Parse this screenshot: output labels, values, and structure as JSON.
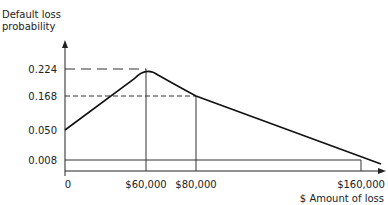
{
  "chart_data": {
    "type": "line",
    "title": "",
    "ylabel_lines": [
      "Default loss",
      "probability"
    ],
    "xlabel": "$ Amount of loss",
    "x_ticks": [
      {
        "value": 0,
        "label": "0"
      },
      {
        "value": 60000,
        "label": "$60,000"
      },
      {
        "value": 80000,
        "label": "$80,000"
      },
      {
        "value": 160000,
        "label": "$160,000"
      }
    ],
    "y_ticks": [
      {
        "value": 0.224,
        "label": "0.224"
      },
      {
        "value": 0.168,
        "label": "0.168"
      },
      {
        "value": 0.05,
        "label": "0.050"
      },
      {
        "value": 0.008,
        "label": "0.008"
      }
    ],
    "series": [
      {
        "name": "Default loss distribution",
        "points": [
          {
            "x": 0,
            "y": 0.05
          },
          {
            "x": 60000,
            "y": 0.224
          },
          {
            "x": 80000,
            "y": 0.168
          },
          {
            "x": 160000,
            "y": 0.008
          }
        ]
      }
    ],
    "reference_lines": [
      {
        "type": "horizontal",
        "y": 0.224,
        "to_x": 60000,
        "style": "long-dash"
      },
      {
        "type": "horizontal",
        "y": 0.168,
        "to_x": 80000,
        "style": "dash"
      },
      {
        "type": "horizontal",
        "y": 0.008,
        "to_x": 160000,
        "style": "solid"
      },
      {
        "type": "vertical",
        "x": 60000,
        "to_y": 0.224,
        "style": "solid"
      },
      {
        "type": "vertical",
        "x": 80000,
        "to_y": 0.168,
        "style": "solid"
      },
      {
        "type": "vertical",
        "x": 160000,
        "to_y": 0.008,
        "style": "solid"
      }
    ],
    "grid": false,
    "legend": "none"
  }
}
